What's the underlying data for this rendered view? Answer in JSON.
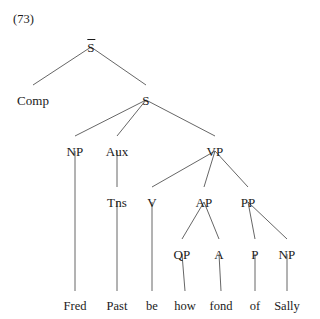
{
  "figure": {
    "example_number": "(73)",
    "sentence": "Fred Past be how fond of Sally",
    "background_color": "#ffffff",
    "line_color": "#555555",
    "text_color": "#1a1a1a"
  },
  "tree": {
    "type": "constituency-syntax-tree",
    "nodes": [
      {
        "id": "sbar",
        "label": "S",
        "overbar": true,
        "x": 91,
        "y": 41
      },
      {
        "id": "comp",
        "label": "Comp",
        "overbar": false,
        "x": 33,
        "y": 94
      },
      {
        "id": "s",
        "label": "S",
        "overbar": false,
        "x": 146,
        "y": 94
      },
      {
        "id": "np1",
        "label": "NP",
        "overbar": false,
        "x": 75,
        "y": 145
      },
      {
        "id": "aux",
        "label": "Aux",
        "overbar": false,
        "x": 117,
        "y": 145
      },
      {
        "id": "vp",
        "label": "VP",
        "overbar": false,
        "x": 215,
        "y": 145
      },
      {
        "id": "tns",
        "label": "Tns",
        "overbar": false,
        "x": 117,
        "y": 196
      },
      {
        "id": "v",
        "label": "V",
        "overbar": false,
        "x": 152,
        "y": 196
      },
      {
        "id": "ap",
        "label": "AP",
        "overbar": false,
        "x": 204,
        "y": 196
      },
      {
        "id": "pp",
        "label": "PP",
        "overbar": false,
        "x": 248,
        "y": 196
      },
      {
        "id": "qp",
        "label": "QP",
        "overbar": false,
        "x": 182,
        "y": 248
      },
      {
        "id": "a",
        "label": "A",
        "overbar": false,
        "x": 219,
        "y": 248
      },
      {
        "id": "p",
        "label": "P",
        "overbar": false,
        "x": 255,
        "y": 248
      },
      {
        "id": "np2",
        "label": "NP",
        "overbar": false,
        "x": 287,
        "y": 248
      }
    ],
    "terminals": [
      {
        "id": "w-fred",
        "label": "Fred",
        "parent": "np1",
        "x": 75,
        "y": 300
      },
      {
        "id": "w-past",
        "label": "Past",
        "parent": "tns",
        "x": 117,
        "y": 300
      },
      {
        "id": "w-be",
        "label": "be",
        "parent": "v",
        "x": 152,
        "y": 300
      },
      {
        "id": "w-how",
        "label": "how",
        "parent": "qp",
        "x": 185,
        "y": 300
      },
      {
        "id": "w-fond",
        "label": "fond",
        "parent": "a",
        "x": 221,
        "y": 300
      },
      {
        "id": "w-of",
        "label": "of",
        "parent": "p",
        "x": 255,
        "y": 300
      },
      {
        "id": "w-sally",
        "label": "Sally",
        "parent": "np2",
        "x": 287,
        "y": 300
      }
    ],
    "edges": [
      {
        "from": "sbar",
        "to": "comp",
        "x1": 91,
        "y1": 47,
        "x2": 33,
        "y2": 85
      },
      {
        "from": "sbar",
        "to": "s",
        "x1": 91,
        "y1": 47,
        "x2": 146,
        "y2": 85
      },
      {
        "from": "s",
        "to": "np1",
        "x1": 146,
        "y1": 100,
        "x2": 75,
        "y2": 136
      },
      {
        "from": "s",
        "to": "aux",
        "x1": 146,
        "y1": 100,
        "x2": 117,
        "y2": 136
      },
      {
        "from": "s",
        "to": "vp",
        "x1": 146,
        "y1": 100,
        "x2": 215,
        "y2": 136
      },
      {
        "from": "np1",
        "to": "w-fred",
        "x1": 75,
        "y1": 151,
        "x2": 75,
        "y2": 291
      },
      {
        "from": "aux",
        "to": "tns",
        "x1": 117,
        "y1": 151,
        "x2": 117,
        "y2": 187
      },
      {
        "from": "vp",
        "to": "v",
        "x1": 215,
        "y1": 151,
        "x2": 152,
        "y2": 187
      },
      {
        "from": "vp",
        "to": "ap",
        "x1": 215,
        "y1": 151,
        "x2": 204,
        "y2": 187
      },
      {
        "from": "vp",
        "to": "pp",
        "x1": 215,
        "y1": 151,
        "x2": 248,
        "y2": 187
      },
      {
        "from": "tns",
        "to": "w-past",
        "x1": 117,
        "y1": 202,
        "x2": 117,
        "y2": 291
      },
      {
        "from": "v",
        "to": "w-be",
        "x1": 152,
        "y1": 202,
        "x2": 152,
        "y2": 291
      },
      {
        "from": "ap",
        "to": "qp",
        "x1": 204,
        "y1": 202,
        "x2": 182,
        "y2": 239
      },
      {
        "from": "ap",
        "to": "a",
        "x1": 204,
        "y1": 202,
        "x2": 219,
        "y2": 239
      },
      {
        "from": "pp",
        "to": "p",
        "x1": 248,
        "y1": 202,
        "x2": 255,
        "y2": 239
      },
      {
        "from": "pp",
        "to": "np2",
        "x1": 248,
        "y1": 202,
        "x2": 287,
        "y2": 239
      },
      {
        "from": "qp",
        "to": "w-how",
        "x1": 182,
        "y1": 254,
        "x2": 185,
        "y2": 291
      },
      {
        "from": "a",
        "to": "w-fond",
        "x1": 219,
        "y1": 254,
        "x2": 221,
        "y2": 291
      },
      {
        "from": "p",
        "to": "w-of",
        "x1": 255,
        "y1": 254,
        "x2": 255,
        "y2": 291
      },
      {
        "from": "np2",
        "to": "w-sally",
        "x1": 287,
        "y1": 254,
        "x2": 287,
        "y2": 291
      }
    ]
  }
}
